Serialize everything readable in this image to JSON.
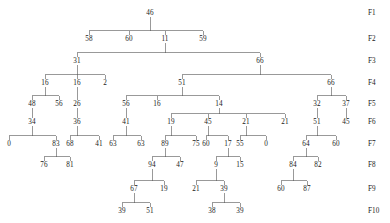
{
  "figure": {
    "type": "tree-diagram",
    "stroke_color": "#555555",
    "text_color": "#1a1a1a",
    "background": "#ffffff"
  },
  "level_labels": [
    {
      "name": "F1",
      "y": 14
    },
    {
      "name": "F2",
      "y": 40
    },
    {
      "name": "F3",
      "y": 62
    },
    {
      "name": "F4",
      "y": 84
    },
    {
      "name": "F5",
      "y": 105
    },
    {
      "name": "F6",
      "y": 123
    },
    {
      "name": "F7",
      "y": 145
    },
    {
      "name": "F8",
      "y": 166
    },
    {
      "name": "F9",
      "y": 190
    },
    {
      "name": "F10",
      "y": 212
    }
  ],
  "level_label_x": 368,
  "nodes": [
    {
      "id": "n0",
      "value": "46",
      "x": 150,
      "y": 14,
      "level": "F1",
      "parent": null
    },
    {
      "id": "n0-0",
      "value": "58",
      "x": 89,
      "y": 40,
      "level": "F2",
      "parent": "n0"
    },
    {
      "id": "n0-1",
      "value": "60",
      "x": 129,
      "y": 40,
      "level": "F2",
      "parent": "n0"
    },
    {
      "id": "n0-2",
      "value": "11",
      "x": 165,
      "y": 40,
      "level": "F2",
      "parent": "n0"
    },
    {
      "id": "n0-3",
      "value": "59",
      "x": 203,
      "y": 40,
      "level": "F2",
      "parent": "n0"
    },
    {
      "id": "n2-0",
      "value": "31",
      "x": 77,
      "y": 62,
      "level": "F3",
      "parent": "n0-2"
    },
    {
      "id": "n2-1",
      "value": "66",
      "x": 260,
      "y": 62,
      "level": "F3",
      "parent": "n0-2"
    },
    {
      "id": "n31-0",
      "value": "16",
      "x": 45,
      "y": 84,
      "level": "F4",
      "parent": "n2-0"
    },
    {
      "id": "n31-1",
      "value": "16",
      "x": 77,
      "y": 84,
      "level": "F4",
      "parent": "n2-0"
    },
    {
      "id": "n31-2",
      "value": "2",
      "x": 105,
      "y": 84,
      "level": "F4",
      "parent": "n2-0"
    },
    {
      "id": "n66-0",
      "value": "51",
      "x": 182,
      "y": 84,
      "level": "F4",
      "parent": "n2-1"
    },
    {
      "id": "n66-1",
      "value": "66",
      "x": 331,
      "y": 84,
      "level": "F4",
      "parent": "n2-1"
    },
    {
      "id": "n16a-0",
      "value": "48",
      "x": 32,
      "y": 105,
      "level": "F5",
      "parent": "n31-0"
    },
    {
      "id": "n16a-1",
      "value": "56",
      "x": 59,
      "y": 105,
      "level": "F5",
      "parent": "n31-0"
    },
    {
      "id": "n16b-0",
      "value": "26",
      "x": 77,
      "y": 105,
      "level": "F5",
      "parent": "n31-1"
    },
    {
      "id": "n51-0",
      "value": "56",
      "x": 126,
      "y": 105,
      "level": "F5",
      "parent": "n66-0"
    },
    {
      "id": "n51-1",
      "value": "16",
      "x": 157,
      "y": 105,
      "level": "F5",
      "parent": "n66-0"
    },
    {
      "id": "n51-2",
      "value": "14",
      "x": 219,
      "y": 105,
      "level": "F5",
      "parent": "n66-0"
    },
    {
      "id": "n66b-0",
      "value": "32",
      "x": 317,
      "y": 105,
      "level": "F5",
      "parent": "n66-1"
    },
    {
      "id": "n66b-1",
      "value": "37",
      "x": 346,
      "y": 105,
      "level": "F5",
      "parent": "n66-1"
    },
    {
      "id": "n48-0",
      "value": "34",
      "x": 32,
      "y": 123,
      "level": "F6",
      "parent": "n16a-0"
    },
    {
      "id": "n26-0",
      "value": "36",
      "x": 77,
      "y": 123,
      "level": "F6",
      "parent": "n16b-0"
    },
    {
      "id": "n56-0",
      "value": "41",
      "x": 126,
      "y": 123,
      "level": "F6",
      "parent": "n51-0"
    },
    {
      "id": "n14-0",
      "value": "19",
      "x": 171,
      "y": 123,
      "level": "F6",
      "parent": "n51-2"
    },
    {
      "id": "n14-1",
      "value": "45",
      "x": 208,
      "y": 123,
      "level": "F6",
      "parent": "n51-2"
    },
    {
      "id": "n14-2",
      "value": "21",
      "x": 246,
      "y": 123,
      "level": "F6",
      "parent": "n51-2"
    },
    {
      "id": "n14-3",
      "value": "21",
      "x": 285,
      "y": 123,
      "level": "F6",
      "parent": "n51-2"
    },
    {
      "id": "n32-0",
      "value": "51",
      "x": 317,
      "y": 123,
      "level": "F6",
      "parent": "n66b-0"
    },
    {
      "id": "n37-0",
      "value": "45",
      "x": 346,
      "y": 123,
      "level": "F6",
      "parent": "n66b-1"
    },
    {
      "id": "n34-0",
      "value": "0",
      "x": 9,
      "y": 145,
      "level": "F7",
      "parent": "n48-0"
    },
    {
      "id": "n34-1",
      "value": "83",
      "x": 56,
      "y": 145,
      "level": "F7",
      "parent": "n48-0"
    },
    {
      "id": "n36-0",
      "value": "68",
      "x": 70,
      "y": 145,
      "level": "F7",
      "parent": "n26-0"
    },
    {
      "id": "n36-1",
      "value": "41",
      "x": 99,
      "y": 145,
      "level": "F7",
      "parent": "n26-0"
    },
    {
      "id": "n41-0",
      "value": "63",
      "x": 113,
      "y": 145,
      "level": "F7",
      "parent": "n56-0"
    },
    {
      "id": "n41-1",
      "value": "63",
      "x": 141,
      "y": 145,
      "level": "F7",
      "parent": "n56-0"
    },
    {
      "id": "n19-0",
      "value": "89",
      "x": 165,
      "y": 145,
      "level": "F7",
      "parent": "n14-0"
    },
    {
      "id": "n19-1",
      "value": "75",
      "x": 196,
      "y": 145,
      "level": "F7",
      "parent": "n14-0"
    },
    {
      "id": "n45-0",
      "value": "60",
      "x": 206,
      "y": 145,
      "level": "F7",
      "parent": "n14-1"
    },
    {
      "id": "n45-1",
      "value": "17",
      "x": 228,
      "y": 145,
      "level": "F7",
      "parent": "n14-1"
    },
    {
      "id": "n21-0",
      "value": "55",
      "x": 240,
      "y": 145,
      "level": "F7",
      "parent": "n14-2"
    },
    {
      "id": "n21-1",
      "value": "0",
      "x": 266,
      "y": 145,
      "level": "F7",
      "parent": "n14-2"
    },
    {
      "id": "n51b-0",
      "value": "64",
      "x": 306,
      "y": 145,
      "level": "F7",
      "parent": "n32-0"
    },
    {
      "id": "n51b-1",
      "value": "60",
      "x": 336,
      "y": 145,
      "level": "F7",
      "parent": "n32-0"
    },
    {
      "id": "n83-0",
      "value": "76",
      "x": 44,
      "y": 166,
      "level": "F8",
      "parent": "n34-1"
    },
    {
      "id": "n83-1",
      "value": "81",
      "x": 70,
      "y": 166,
      "level": "F8",
      "parent": "n34-1"
    },
    {
      "id": "n89-0",
      "value": "94",
      "x": 152,
      "y": 166,
      "level": "F8",
      "parent": "n19-0"
    },
    {
      "id": "n89-1",
      "value": "47",
      "x": 180,
      "y": 166,
      "level": "F8",
      "parent": "n19-0"
    },
    {
      "id": "n17-0",
      "value": "9",
      "x": 216,
      "y": 166,
      "level": "F8",
      "parent": "n45-1"
    },
    {
      "id": "n17-1",
      "value": "15",
      "x": 240,
      "y": 166,
      "level": "F8",
      "parent": "n45-1"
    },
    {
      "id": "n64-0",
      "value": "84",
      "x": 293,
      "y": 166,
      "level": "F8",
      "parent": "n51b-0"
    },
    {
      "id": "n64-1",
      "value": "82",
      "x": 318,
      "y": 166,
      "level": "F8",
      "parent": "n51b-0"
    },
    {
      "id": "n94-0",
      "value": "67",
      "x": 134,
      "y": 190,
      "level": "F9",
      "parent": "n89-0"
    },
    {
      "id": "n94-1",
      "value": "19",
      "x": 164,
      "y": 190,
      "level": "F9",
      "parent": "n89-0"
    },
    {
      "id": "n9-0",
      "value": "21",
      "x": 196,
      "y": 190,
      "level": "F9",
      "parent": "n17-0"
    },
    {
      "id": "n9-1",
      "value": "39",
      "x": 224,
      "y": 190,
      "level": "F9",
      "parent": "n17-0"
    },
    {
      "id": "n84-0",
      "value": "60",
      "x": 281,
      "y": 190,
      "level": "F9",
      "parent": "n64-0"
    },
    {
      "id": "n84-1",
      "value": "87",
      "x": 307,
      "y": 190,
      "level": "F9",
      "parent": "n64-0"
    },
    {
      "id": "n67-0",
      "value": "39",
      "x": 122,
      "y": 212,
      "level": "F10",
      "parent": "n94-0"
    },
    {
      "id": "n67-1",
      "value": "51",
      "x": 150,
      "y": 212,
      "level": "F10",
      "parent": "n94-0"
    },
    {
      "id": "n39-0",
      "value": "38",
      "x": 212,
      "y": 212,
      "level": "F10",
      "parent": "n9-1"
    },
    {
      "id": "n39-1",
      "value": "39",
      "x": 240,
      "y": 212,
      "level": "F10",
      "parent": "n9-1"
    }
  ]
}
